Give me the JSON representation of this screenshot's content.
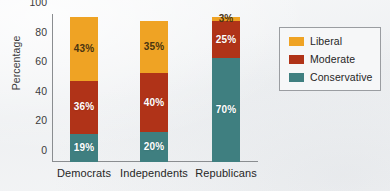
{
  "chart_data": {
    "type": "bar",
    "subtype": "stacked-bar",
    "title": "",
    "xlabel": "",
    "ylabel": "Percentage",
    "ylim": [
      0,
      100
    ],
    "yticks": [
      0,
      20,
      40,
      60,
      80,
      100
    ],
    "ytick_labels": [
      "0",
      "20",
      "40",
      "60",
      "80",
      "100"
    ],
    "grid": false,
    "legend_position": "right",
    "categories": [
      "Democrats",
      "Independents",
      "Republicans"
    ],
    "series": [
      {
        "name": "Conservative",
        "color": "#3f7f80",
        "values": [
          19,
          20,
          70
        ],
        "labels": [
          "19%",
          "20%",
          "70%"
        ],
        "label_color": "light"
      },
      {
        "name": "Moderate",
        "color": "#b03318",
        "values": [
          36,
          40,
          25
        ],
        "labels": [
          "36%",
          "40%",
          "25%"
        ],
        "label_color": "light"
      },
      {
        "name": "Liberal",
        "color": "#efa324",
        "values": [
          43,
          35,
          3
        ],
        "labels": [
          "43%",
          "35%",
          "3%"
        ],
        "label_color": "dark"
      }
    ],
    "stack_order_bottom_to_top": [
      "Conservative",
      "Moderate",
      "Liberal"
    ],
    "totals": [
      98,
      95,
      98
    ],
    "legend_entries": [
      {
        "label": "Liberal",
        "color": "#efa324"
      },
      {
        "label": "Moderate",
        "color": "#b03318"
      },
      {
        "label": "Conservative",
        "color": "#3f7f80"
      }
    ],
    "colors": {
      "liberal": "#efa324",
      "moderate": "#b03318",
      "conservative": "#3f7f80",
      "axis": "#8a8d90",
      "background": "#f2f3f5",
      "text": "#262626"
    }
  }
}
